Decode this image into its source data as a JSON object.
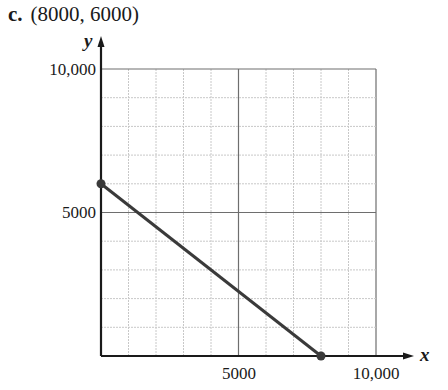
{
  "heading": {
    "part_label": "c.",
    "point_text": "(8000, 6000)"
  },
  "chart_data": {
    "type": "line",
    "title": "(8000, 6000)",
    "xlabel": "x",
    "ylabel": "y",
    "xlim": [
      0,
      10000
    ],
    "ylim": [
      0,
      10000
    ],
    "grid": true,
    "minor_grid_step": 1000,
    "major_grid_step": 5000,
    "x_tick_labels": [
      "5000",
      "10,000"
    ],
    "y_tick_labels": [
      "5000",
      "10,000"
    ],
    "series": [
      {
        "name": "segment",
        "points": [
          [
            0,
            6000
          ],
          [
            8000,
            0
          ]
        ],
        "endpoint_markers": true
      }
    ],
    "legend": null
  },
  "colors": {
    "axis": "#1a1a1a",
    "minor_grid": "#c8c8c8",
    "major_grid": "#6e6e6e",
    "line": "#3a3a3a"
  }
}
